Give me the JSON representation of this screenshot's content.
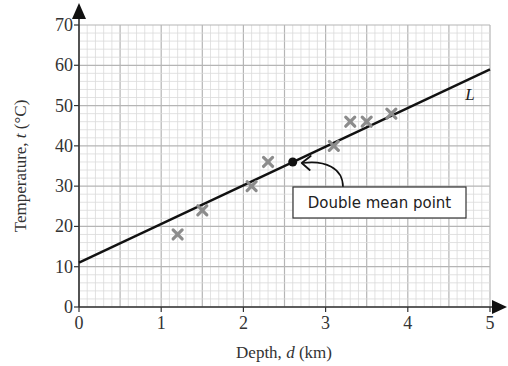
{
  "chart_data": {
    "type": "scatter",
    "title": "",
    "xlabel": "Depth, d (km)",
    "ylabel": "Temperature, t (°C)",
    "xlabel_parts": {
      "pre": "Depth, ",
      "var": "d",
      "post": " (km)"
    },
    "ylabel_parts": {
      "pre": "Temperature, ",
      "var": "t",
      "post": " (°C)"
    },
    "xlim": [
      0,
      5
    ],
    "ylim": [
      0,
      70
    ],
    "x_ticks": [
      0,
      1,
      2,
      3,
      4,
      5
    ],
    "y_ticks": [
      0,
      10,
      20,
      30,
      40,
      50,
      60,
      70
    ],
    "grid": true,
    "minor_grid_per_major": 5,
    "series": [
      {
        "name": "Data",
        "marker": "x",
        "color": "#8c8c8c",
        "points": [
          {
            "x": 1.2,
            "y": 18
          },
          {
            "x": 1.5,
            "y": 24
          },
          {
            "x": 2.1,
            "y": 30
          },
          {
            "x": 2.3,
            "y": 36
          },
          {
            "x": 3.1,
            "y": 40
          },
          {
            "x": 3.3,
            "y": 46
          },
          {
            "x": 3.5,
            "y": 46
          },
          {
            "x": 3.8,
            "y": 48
          }
        ]
      }
    ],
    "line": {
      "name": "L",
      "label": "L",
      "x": [
        0,
        5
      ],
      "y": [
        11,
        59
      ],
      "color": "#111111"
    },
    "double_mean_point": {
      "x": 2.6,
      "y": 36
    },
    "annotations": [
      {
        "text": "Double mean point",
        "target": {
          "x": 2.6,
          "y": 36
        }
      }
    ]
  }
}
